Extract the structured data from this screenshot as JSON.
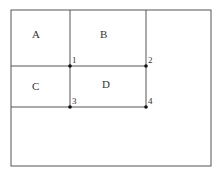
{
  "diagram": {
    "regions": [
      {
        "label": "A",
        "x": 32,
        "y": 38
      },
      {
        "label": "B",
        "x": 103,
        "y": 38
      },
      {
        "label": "C",
        "x": 34,
        "y": 89
      },
      {
        "label": "D",
        "x": 104,
        "y": 87
      }
    ],
    "points": [
      {
        "label": "1",
        "x": 70,
        "y": 66
      },
      {
        "label": "2",
        "x": 146,
        "y": 66
      },
      {
        "label": "3",
        "x": 70,
        "y": 107
      },
      {
        "label": "4",
        "x": 146,
        "y": 107
      }
    ],
    "colors": {
      "line": "#555555",
      "point": "#111111"
    }
  }
}
